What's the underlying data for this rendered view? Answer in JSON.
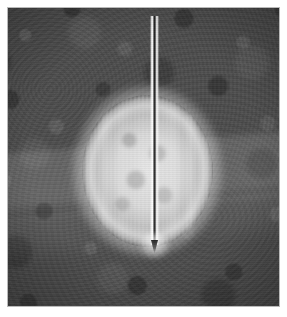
{
  "figure": {
    "domain": "natural-image",
    "kind": "grayscale-radiographic-image",
    "caption": "",
    "width_px": 287,
    "height_px": 317
  },
  "plate": {
    "name": "image-plate",
    "left_px": 8,
    "top_px": 8,
    "width_px": 271,
    "height_px": 298,
    "border_color": "#b9b9b9"
  },
  "background": {
    "label": "mottled tissue background",
    "base_color": "#4d4d4d",
    "texture": "speckled granular mottling",
    "bands": [
      {
        "label": "upper lighter tissue band",
        "rotation_deg": -4.5,
        "top_pct": 44,
        "height_pct": 24,
        "highlight_color": "#6e6e6e"
      },
      {
        "label": "lower lighter tissue band",
        "rotation_deg": -5.5,
        "top_pct": 66,
        "height_pct": 16,
        "highlight_color": "#636363"
      }
    ]
  },
  "specimen": {
    "label": "spherical specimen",
    "shape": "ellipse",
    "left_px": 74,
    "top_px": 87,
    "width_px": 131,
    "height_px": 152,
    "fill_color": "#dedede",
    "rim_color": "#ffffff",
    "features": [
      "bright outer rim",
      "vertical lamellar striations",
      "mottled darker core"
    ]
  },
  "needle": {
    "label": "needle",
    "left_px": 142,
    "top_px": 8,
    "width_px": 9,
    "length_px": 229,
    "shaft_bright_color": "#f5f5f5",
    "shaft_dark_color": "#1e1e1e",
    "tip_glow_color": "#ffffff",
    "orientation": "vertical",
    "entry_edge": "top"
  },
  "margin": {
    "color": "#ffffff"
  }
}
